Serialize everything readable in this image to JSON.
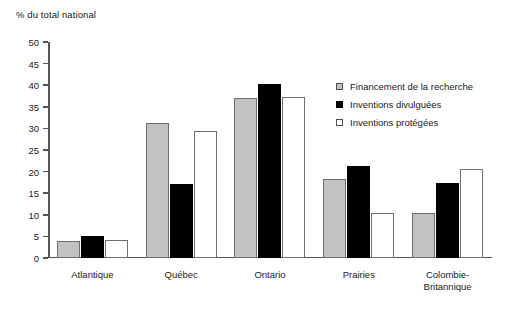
{
  "chart_data": {
    "type": "bar",
    "title": "% du total national",
    "xlabel": "",
    "ylabel": "% du total national",
    "ylim": [
      0,
      50
    ],
    "yticks": [
      0,
      5,
      10,
      15,
      20,
      25,
      30,
      35,
      40,
      45,
      50
    ],
    "grid": false,
    "legend_position": "right-inside",
    "categories": [
      "Atlantique",
      "Québec",
      "Ontario",
      "Prairies",
      "Colombie-\nBritannique"
    ],
    "series": [
      {
        "name": "Financement de la recherche",
        "color": "#c2c2c2",
        "values": [
          4.0,
          31.2,
          37.1,
          18.3,
          10.4
        ]
      },
      {
        "name": "Inventions divulguées",
        "color": "#000000",
        "values": [
          5.1,
          17.2,
          40.3,
          21.2,
          17.4
        ]
      },
      {
        "name": "Inventions protégées",
        "color": "#ffffff",
        "values": [
          4.1,
          29.3,
          37.2,
          10.4,
          20.5
        ]
      }
    ]
  },
  "axis": {
    "title": "% du total national",
    "tick_labels": [
      "0",
      "5",
      "10",
      "15",
      "20",
      "25",
      "30",
      "35",
      "40",
      "45",
      "50"
    ]
  },
  "categories": [
    {
      "line1": "Atlantique",
      "line2": ""
    },
    {
      "line1": "Québec",
      "line2": ""
    },
    {
      "line1": "Ontario",
      "line2": ""
    },
    {
      "line1": "Prairies",
      "line2": ""
    },
    {
      "line1": "Colombie-",
      "line2": "Britannique"
    }
  ],
  "legend": {
    "items": [
      {
        "label": "Financement de la recherche",
        "swatch": "gray-filled-square"
      },
      {
        "label": "Inventions divulguées",
        "swatch": "black-filled-square"
      },
      {
        "label": "Inventions protégées",
        "swatch": "white-outlined-square"
      }
    ]
  }
}
